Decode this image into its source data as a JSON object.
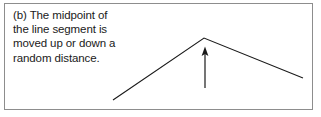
{
  "figure": {
    "label": "(b)",
    "caption_lines": [
      "(b) The midpoint of",
      "the line segment is",
      "moved up or down a",
      "random distance."
    ],
    "caption_full": "(b) The midpoint of the line segment is moved up or down a random distance.",
    "frame": {
      "border_color": "#8d8d8d",
      "background_color": "#ffffff"
    },
    "colors": {
      "text": "#1a1a1a",
      "stroke": "#1a1a1a",
      "background": "#ffffff",
      "border": "#8d8d8d"
    },
    "diagram": {
      "type": "midpoint-displacement-line",
      "stroke_color": "#1a1a1a",
      "stroke_width": 1.1,
      "polyline_points": "113,100 204,38 303,78",
      "vertices": [
        {
          "name": "left-endpoint",
          "x": 113,
          "y": 100
        },
        {
          "name": "displaced-midpoint-apex",
          "x": 204,
          "y": 38
        },
        {
          "name": "right-endpoint",
          "x": 303,
          "y": 78
        }
      ],
      "arrow": {
        "name": "displacement-arrow",
        "direction": "up",
        "shaft_x": 205,
        "tip_y": 47,
        "tail_y": 88,
        "head_width": 7,
        "head_height": 9,
        "stroke_width": 1.2
      }
    }
  }
}
